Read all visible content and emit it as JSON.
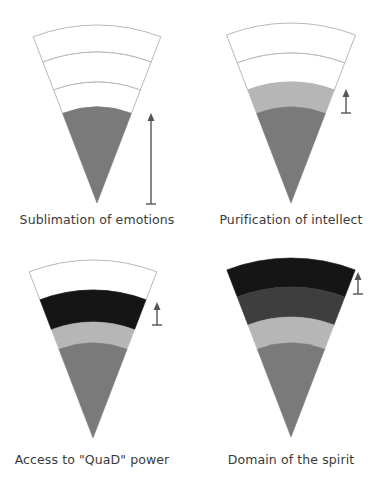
{
  "colors": {
    "empty": "#ffffff",
    "outline": "#b8b8b8",
    "medium_gray": "#7a7a7a",
    "light_gray": "#b6b6b6",
    "dark_gray": "#3e3e3e",
    "black": "#151515",
    "arrow": "#555555",
    "text": "#3a3a3a"
  },
  "panels": [
    {
      "id": "sublimation",
      "caption": "Sublimation of emotions",
      "apex": [
        97,
        203
      ],
      "half_angle_deg": 21,
      "bands": [
        {
          "r_outer": 178,
          "r_inner": 151,
          "fill": "empty"
        },
        {
          "r_outer": 151,
          "r_inner": 121,
          "fill": "empty"
        },
        {
          "r_outer": 121,
          "r_inner": 96,
          "fill": "empty"
        },
        {
          "r_outer": 96,
          "r_inner": 0,
          "fill": "medium_gray"
        }
      ],
      "arrow": {
        "x": 151,
        "y_top": 113,
        "y_bottom": 204
      },
      "caption_pos": [
        0,
        212
      ]
    },
    {
      "id": "purification",
      "caption": "Purification of intellect",
      "apex": [
        291,
        203
      ],
      "half_angle_deg": 21,
      "bands": [
        {
          "r_outer": 180,
          "r_inner": 150,
          "fill": "empty"
        },
        {
          "r_outer": 150,
          "r_inner": 121,
          "fill": "empty"
        },
        {
          "r_outer": 121,
          "r_inner": 96,
          "fill": "light_gray"
        },
        {
          "r_outer": 96,
          "r_inner": 0,
          "fill": "medium_gray"
        }
      ],
      "arrow": {
        "x": 346,
        "y_top": 89,
        "y_bottom": 113
      },
      "caption_pos": [
        194,
        212
      ]
    },
    {
      "id": "quad_power",
      "caption": "Access to \"QuaD\" power",
      "apex": [
        93,
        438
      ],
      "half_angle_deg": 21,
      "bands": [
        {
          "r_outer": 178,
          "r_inner": 148,
          "fill": "empty"
        },
        {
          "r_outer": 148,
          "r_inner": 116,
          "fill": "black"
        },
        {
          "r_outer": 116,
          "r_inner": 95,
          "fill": "light_gray"
        },
        {
          "r_outer": 95,
          "r_inner": 0,
          "fill": "medium_gray"
        }
      ],
      "arrow": {
        "x": 157,
        "y_top": 302,
        "y_bottom": 325
      },
      "caption_pos": [
        -5,
        452
      ]
    },
    {
      "id": "spirit",
      "caption": "Domain of the spirit",
      "apex": [
        291,
        437
      ],
      "half_angle_deg": 21,
      "bands": [
        {
          "r_outer": 179,
          "r_inner": 150,
          "fill": "black"
        },
        {
          "r_outer": 150,
          "r_inner": 120,
          "fill": "dark_gray"
        },
        {
          "r_outer": 120,
          "r_inner": 94,
          "fill": "light_gray"
        },
        {
          "r_outer": 94,
          "r_inner": 0,
          "fill": "medium_gray"
        }
      ],
      "arrow": {
        "x": 358,
        "y_top": 272,
        "y_bottom": 294
      },
      "caption_pos": [
        194,
        452
      ]
    }
  ]
}
